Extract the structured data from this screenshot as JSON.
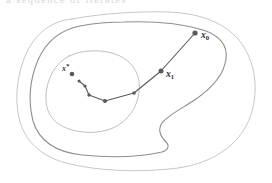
{
  "figure": {
    "kind": "optimization-contour-plot",
    "background_color": "#ffffff",
    "cropped_caption_remnant": "a sequence of iterates",
    "labels": {
      "x0": {
        "base": "x",
        "subscript": "0",
        "color": "#2b2b2b"
      },
      "x1": {
        "base": "x",
        "subscript": "1",
        "color": "#2b2b2b"
      },
      "xstar": {
        "base": "x",
        "superscript": "*",
        "color": "#3a3a3a"
      }
    },
    "contours": [
      {
        "name": "outer-level-set",
        "stroke": "#b9b9b9",
        "stroke_width": 0.8,
        "path": "M 72 19 C 52 21 36 33 27 52 C 18 71 14 96 19 118 C 24 140 40 156 66 163 C 96 171 140 173 178 168 C 212 163 238 146 249 120 C 259 95 257 66 242 44 C 227 23 200 13 168 12 C 136 11 98 14 72 19 Z"
      },
      {
        "name": "middle-level-set",
        "stroke": "#8e8e8e",
        "stroke_width": 1.1,
        "path": "M 80 26 C 60 30 46 42 38 60 C 30 79 28 101 33 121 C 39 141 55 152 82 155 C 112 158 140 157 162 152 C 168 150 170 146 166 142 C 160 136 158 129 162 123 C 168 115 183 108 196 99 C 212 88 224 74 226 59 C 228 45 219 35 203 30 C 180 23 150 21 124 22 C 105 22 90 24 80 26 Z"
      },
      {
        "name": "inner-level-set",
        "stroke": "#b0b0b0",
        "stroke_width": 0.8,
        "path": "M 69 56 C 55 63 47 79 46 95 C 45 110 51 121 64 127 C 79 134 99 134 113 128 C 128 121 137 108 139 92 C 141 76 134 63 120 56 C 105 49 84 49 69 56 Z"
      }
    ],
    "iterate_path": {
      "stroke": "#5a5a5a",
      "stroke_width": 1.1,
      "dot_color": "#595959",
      "points": [
        {
          "name": "x0",
          "x": 195,
          "y": 33,
          "r": 2.6,
          "label": "x0",
          "label_dx": 6,
          "label_dy": 5
        },
        {
          "name": "x1",
          "x": 161,
          "y": 71,
          "r": 2.5,
          "label": "x1",
          "label_dx": 5,
          "label_dy": 6
        },
        {
          "name": "x2",
          "x": 134,
          "y": 93,
          "r": 1.8,
          "label": null
        },
        {
          "name": "x3",
          "x": 105,
          "y": 101,
          "r": 2.1,
          "label": null
        },
        {
          "name": "x4",
          "x": 89,
          "y": 95,
          "r": 1.7,
          "label": null
        },
        {
          "name": "x5",
          "x": 85,
          "y": 86,
          "r": 1.6,
          "label": null
        },
        {
          "name": "x6",
          "x": 79,
          "y": 81,
          "r": 1.5,
          "label": null
        }
      ],
      "solution_point": {
        "name": "xstar",
        "x": 72,
        "y": 74,
        "r": 2.3,
        "label": "xstar",
        "label_dx": -10,
        "label_dy": -3
      }
    }
  }
}
